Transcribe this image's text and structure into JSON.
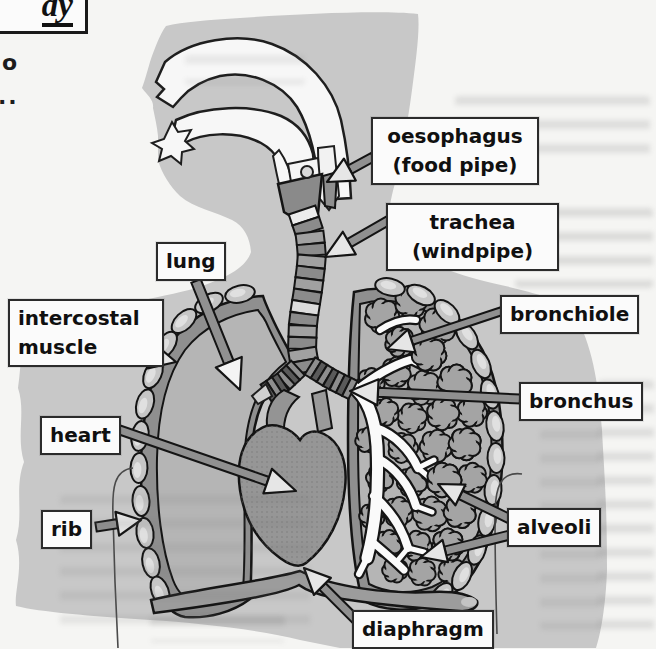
{
  "figure": {
    "title_fragment": "dy",
    "edge_fragments": {
      "fragment_o": "o",
      "fragment_dots": ".."
    },
    "labels": {
      "oesophagus": {
        "line1": "oesophagus",
        "line2": "(food pipe)"
      },
      "trachea": {
        "line1": "trachea",
        "line2": "(windpipe)"
      },
      "lung": {
        "text": "lung"
      },
      "intercostal_muscle": {
        "line1": "intercostal",
        "line2": "muscle"
      },
      "heart": {
        "text": "heart"
      },
      "rib": {
        "text": "rib"
      },
      "bronchiole": {
        "text": "bronchiole"
      },
      "bronchus": {
        "text": "bronchus"
      },
      "alveoli": {
        "text": "alveoli"
      },
      "diaphragm": {
        "text": "diaphragm"
      }
    },
    "colors": {
      "page_bg": "#f5f5f3",
      "silhouette": "#c8c8c8",
      "box_bg": "#fbfbfb",
      "box_border": "#2b2b2b",
      "label_text": "#101010",
      "outline": "#141414",
      "lung_wall": "#8f8f8f",
      "lung_fill": "#b5b5b5",
      "rib_fill": "#c6c6c6",
      "heart_fill": "#969696",
      "diaphragm_fill": "#9c9c9c",
      "alveoli_fill": "#a4a4a4",
      "airway_white": "#f7f7f7",
      "arrow_shaft": "#909090",
      "arrow_head": "#e6e6e6"
    }
  }
}
